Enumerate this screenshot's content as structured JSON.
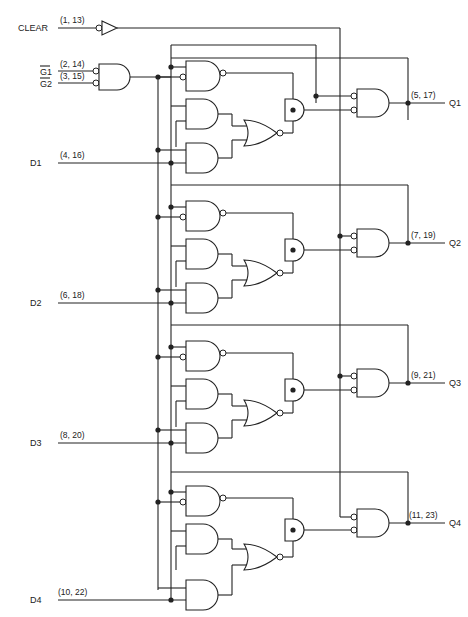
{
  "diagram": {
    "type": "logic-diagram",
    "inputs": {
      "clear": {
        "label": "CLEAR",
        "pins": "(1, 13)"
      },
      "g1": {
        "label": "G1",
        "overbar": true,
        "pins": "(2, 14)"
      },
      "g2": {
        "label": "G2",
        "overbar": true,
        "pins": "(3, 15)"
      }
    },
    "stages": [
      {
        "d_label": "D1",
        "d_pins": "(4, 16)",
        "q_label": "Q1",
        "q_pins": "(5, 17)"
      },
      {
        "d_label": "D2",
        "d_pins": "(6, 18)",
        "q_label": "Q2",
        "q_pins": "(7, 19)"
      },
      {
        "d_label": "D3",
        "d_pins": "(8, 20)",
        "q_label": "Q3",
        "q_pins": "(9, 21)"
      },
      {
        "d_label": "D4",
        "d_pins": "(10, 22)",
        "q_label": "Q4",
        "q_pins": "(11, 23)"
      }
    ],
    "colors": {
      "ink": "#222222",
      "background": "#ffffff"
    }
  }
}
